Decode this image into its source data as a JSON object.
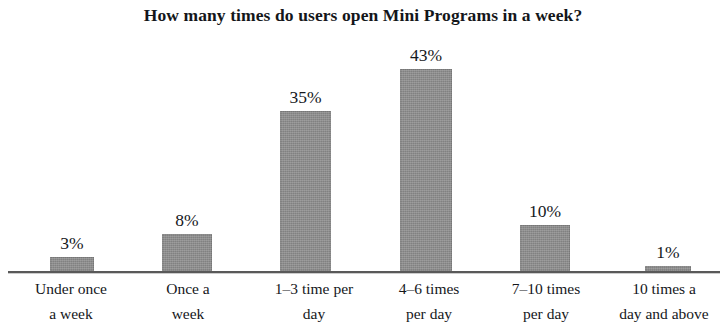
{
  "chart_data": {
    "type": "bar",
    "title": "How many times do users open Mini Programs in a week?",
    "xlabel": "",
    "ylabel": "",
    "ylim": [
      0,
      43
    ],
    "grid": false,
    "legend": null,
    "orientation": "vertical",
    "value_suffix": "%",
    "categories": [
      "Under once\na week",
      "Once a\nweek",
      "1–3 time per\nday",
      "4–6 times\nper day",
      "7–10 times\nper day",
      "10 times a\nday and above"
    ],
    "values": [
      3,
      8,
      35,
      43,
      10,
      1
    ],
    "data_labels": [
      "3%",
      "8%",
      "35%",
      "43%",
      "10%",
      "1%"
    ],
    "bar_color": "#8f8f8f",
    "axis_color": "#4c4c4c",
    "background_color": "#ffffff",
    "text_color": "#15171b"
  },
  "bars": [
    {
      "label": "3%",
      "category": "Under once\na week",
      "left": 50,
      "width": 44,
      "height": 14
    },
    {
      "label": "8%",
      "category": "Once a\nweek",
      "left": 162,
      "width": 50,
      "height": 37
    },
    {
      "label": "35%",
      "category": "1–3 time per\nday",
      "left": 280,
      "width": 51,
      "height": 160
    },
    {
      "label": "43%",
      "category": "4–6 times\nper day",
      "left": 400,
      "width": 52,
      "height": 202
    },
    {
      "label": "10%",
      "category": "7–10 times\nper day",
      "left": 520,
      "width": 50,
      "height": 46
    },
    {
      "label": "1%",
      "category": "10 times a\nday and above",
      "left": 645,
      "width": 46,
      "height": 5
    }
  ],
  "category_label_boxes": [
    {
      "left": 6,
      "width": 130
    },
    {
      "left": 126,
      "width": 124
    },
    {
      "left": 240,
      "width": 148
    },
    {
      "left": 366,
      "width": 126
    },
    {
      "left": 482,
      "width": 128
    },
    {
      "left": 602,
      "width": 124
    }
  ]
}
